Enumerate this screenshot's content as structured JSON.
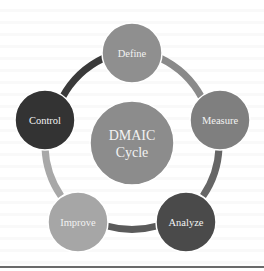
{
  "diagram": {
    "title": "DMAIC Cycle",
    "center": {
      "line1": "DMAIC",
      "line2": "Cycle",
      "color": "#8c8c8c"
    },
    "stages": [
      {
        "id": "define",
        "label": "Define",
        "color": "#8f8f8f"
      },
      {
        "id": "measure",
        "label": "Measure",
        "color": "#7f7f7f"
      },
      {
        "id": "analyze",
        "label": "Analyze",
        "color": "#4a4a4a"
      },
      {
        "id": "improve",
        "label": "Improve",
        "color": "#a6a6a6"
      },
      {
        "id": "control",
        "label": "Control",
        "color": "#333333"
      }
    ],
    "connectors": [
      {
        "from": "Define",
        "to": "Measure",
        "color": "#8a8a8a"
      },
      {
        "from": "Measure",
        "to": "Analyze",
        "color": "#666666"
      },
      {
        "from": "Analyze",
        "to": "Improve",
        "color": "#5a5a5a"
      },
      {
        "from": "Improve",
        "to": "Control",
        "color": "#a8a8a8"
      },
      {
        "from": "Control",
        "to": "Define",
        "color": "#3a3a3a"
      }
    ]
  }
}
